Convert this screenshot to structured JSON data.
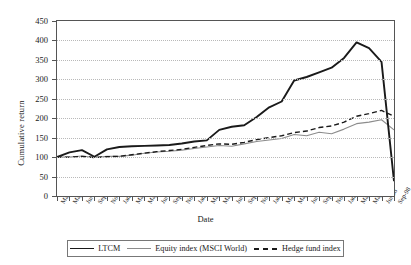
{
  "chart_data": {
    "type": "line",
    "title": "",
    "xlabel": "Date",
    "ylabel": "Cumulative return",
    "ylim": [
      0,
      450
    ],
    "ytick_step": 50,
    "yticks": [
      0,
      50,
      100,
      150,
      200,
      250,
      300,
      350,
      400,
      450
    ],
    "grid": true,
    "legend_position": "bottom",
    "categories": [
      "Mar-94",
      "May-94",
      "Jul-94",
      "Sep-94",
      "Nov-94",
      "Jan-95",
      "Mar-95",
      "May-95",
      "Jul-95",
      "Sep-95",
      "Nov-95",
      "Jan-96",
      "Mar-96",
      "May-96",
      "Jul-96",
      "Sep-96",
      "Nov-96",
      "Jan-97",
      "Mar-97",
      "May-97",
      "Jul-97",
      "Sep-97",
      "Nov-97",
      "Jan-98",
      "Mar-98",
      "May-98",
      "Jul-98",
      "Sep-98"
    ],
    "series": [
      {
        "name": "LTCM",
        "color": "#1a1a1a",
        "style": "solid",
        "width": 1.9,
        "values": [
          100,
          112,
          118,
          101,
          120,
          126,
          128,
          129,
          130,
          131,
          135,
          140,
          143,
          170,
          178,
          182,
          203,
          228,
          243,
          297,
          306,
          318,
          330,
          355,
          395,
          380,
          345,
          38
        ]
      },
      {
        "name": "Equity index (MSCI World)",
        "color": "#8c8c8c",
        "style": "solid",
        "width": 1.1,
        "values": [
          100,
          100,
          103,
          99,
          102,
          102,
          105,
          110,
          113,
          115,
          118,
          122,
          126,
          130,
          128,
          134,
          140,
          144,
          148,
          158,
          155,
          164,
          160,
          172,
          186,
          190,
          196,
          170
        ]
      },
      {
        "name": "Hedge fund index",
        "color": "#1a1a1a",
        "style": "dashed",
        "width": 1.4,
        "values": [
          100,
          100,
          102,
          99,
          101,
          102,
          106,
          110,
          114,
          117,
          120,
          125,
          130,
          134,
          133,
          138,
          145,
          150,
          155,
          163,
          167,
          176,
          180,
          190,
          205,
          212,
          220,
          205
        ]
      }
    ]
  },
  "legend": {
    "items": [
      {
        "label": "LTCM"
      },
      {
        "label": "Equity index (MSCI World)"
      },
      {
        "label": "Hedge fund index"
      }
    ]
  }
}
